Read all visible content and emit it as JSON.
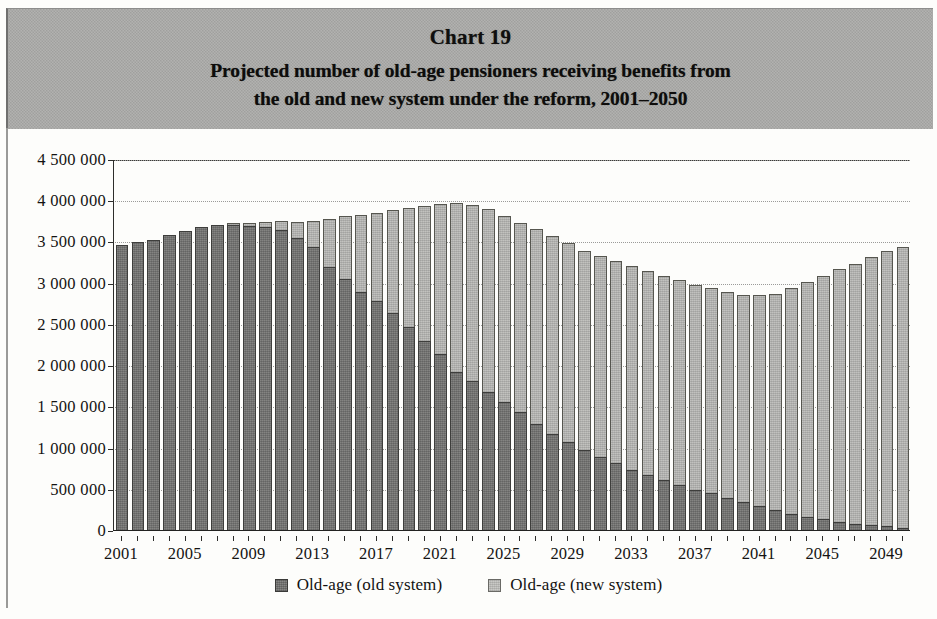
{
  "title": {
    "chart_number": "Chart 19",
    "line1": "Projected number of old-age pensioners receiving benefits from",
    "line2": "the old and new system under the reform, 2001–2050"
  },
  "legend": {
    "items": [
      {
        "label": "Old-age (old system)",
        "color": "#767674"
      },
      {
        "label": "Old-age (new system)",
        "color": "#b6b6b3"
      }
    ]
  },
  "axes": {
    "y_tick_labels": [
      "4 500 000",
      "4 000 000",
      "3 500 000",
      "3 000 000",
      "2 500 000",
      "2 000 000",
      "1 500 000",
      "1 000 000",
      "500 000",
      "0"
    ],
    "x_tick_labels": [
      "2001",
      "2005",
      "2009",
      "2013",
      "2017",
      "2021",
      "2025",
      "2029",
      "2033",
      "2037",
      "2041",
      "2045",
      "2049"
    ]
  },
  "chart_data": {
    "type": "bar",
    "stacked": true,
    "xlabel": "",
    "ylabel": "",
    "ylim": [
      0,
      4500000
    ],
    "ytick_step": 500000,
    "grid": true,
    "legend_position": "bottom",
    "categories": [
      2001,
      2002,
      2003,
      2004,
      2005,
      2006,
      2007,
      2008,
      2009,
      2010,
      2011,
      2012,
      2013,
      2014,
      2015,
      2016,
      2017,
      2018,
      2019,
      2020,
      2021,
      2022,
      2023,
      2024,
      2025,
      2026,
      2027,
      2028,
      2029,
      2030,
      2031,
      2032,
      2033,
      2034,
      2035,
      2036,
      2037,
      2038,
      2039,
      2040,
      2041,
      2042,
      2043,
      2044,
      2045,
      2046,
      2047,
      2048,
      2049,
      2050
    ],
    "series": [
      {
        "name": "Old-age (old system)",
        "color": "#767674",
        "values": [
          3470000,
          3505000,
          3535000,
          3590000,
          3640000,
          3690000,
          3710000,
          3715000,
          3700000,
          3690000,
          3650000,
          3560000,
          3440000,
          3200000,
          3060000,
          2900000,
          2790000,
          2640000,
          2480000,
          2310000,
          2150000,
          1930000,
          1820000,
          1690000,
          1560000,
          1440000,
          1300000,
          1180000,
          1080000,
          980000,
          900000,
          820000,
          740000,
          680000,
          620000,
          560000,
          500000,
          460000,
          400000,
          350000,
          300000,
          250000,
          210000,
          175000,
          140000,
          115000,
          90000,
          70000,
          55000,
          40000
        ]
      },
      {
        "name": "Old-age (new system)",
        "color": "#b6b6b3",
        "values": [
          0,
          0,
          0,
          0,
          0,
          0,
          0,
          20000,
          40000,
          55000,
          110000,
          190000,
          320000,
          590000,
          760000,
          930000,
          1070000,
          1250000,
          1440000,
          1630000,
          1820000,
          2050000,
          2130000,
          2210000,
          2260000,
          2300000,
          2360000,
          2400000,
          2410000,
          2420000,
          2440000,
          2460000,
          2470000,
          2470000,
          2470000,
          2480000,
          2480000,
          2490000,
          2500000,
          2510000,
          2560000,
          2630000,
          2740000,
          2840000,
          2950000,
          3060000,
          3150000,
          3250000,
          3340000,
          3400000
        ]
      }
    ],
    "totals": [
      3470000,
      3505000,
      3535000,
      3590000,
      3640000,
      3690000,
      3710000,
      3735000,
      3740000,
      3745000,
      3760000,
      3750000,
      3760000,
      3790000,
      3820000,
      3830000,
      3860000,
      3890000,
      3920000,
      3940000,
      3970000,
      3980000,
      3950000,
      3900000,
      3820000,
      3740000,
      3660000,
      3580000,
      3490000,
      3400000,
      3340000,
      3280000,
      3210000,
      3150000,
      3090000,
      3040000,
      2980000,
      2950000,
      2900000,
      2860000,
      2860000,
      2880000,
      2950000,
      3015000,
      3090000,
      3175000,
      3240000,
      3320000,
      3395000,
      3440000
    ]
  }
}
